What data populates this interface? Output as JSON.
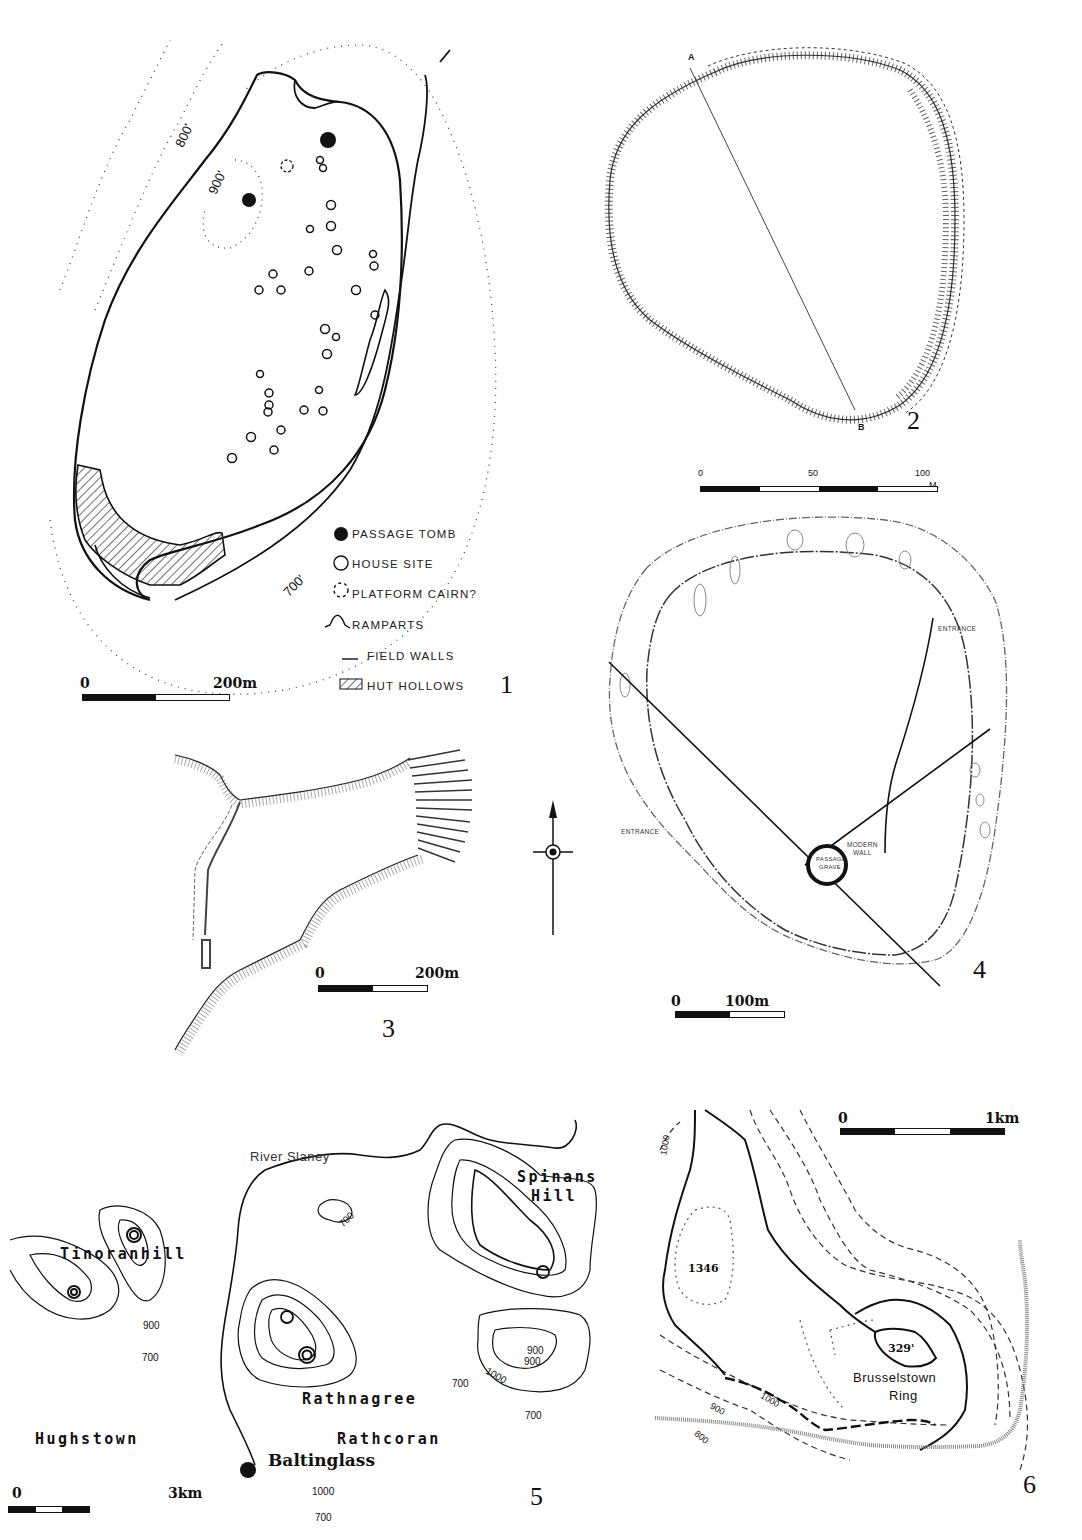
{
  "page": {
    "type": "archaeological site plans figure",
    "figures": [
      {
        "id": 1,
        "number": "1",
        "contours": [
          "800'",
          "900'",
          "700'"
        ],
        "scale": {
          "start": "0",
          "end": "200m"
        },
        "legend": [
          {
            "symbol": "filled-circle",
            "label": "PASSAGE TOMB"
          },
          {
            "symbol": "open-circle",
            "label": "HOUSE SITE"
          },
          {
            "symbol": "dashed-circle",
            "label": "PLATFORM CAIRN?"
          },
          {
            "symbol": "rampart-arc",
            "label": "RAMPARTS"
          },
          {
            "symbol": "short-line",
            "label": "FIELD WALLS"
          },
          {
            "symbol": "hatched-box",
            "label": "HUT HOLLOWS"
          }
        ]
      },
      {
        "id": 2,
        "number": "2",
        "section_labels": [
          "A",
          "B"
        ],
        "scale": {
          "start": "0",
          "mid": "50",
          "end": "100",
          "unit": "M."
        }
      },
      {
        "id": 3,
        "number": "3",
        "scale": {
          "start": "0",
          "end": "200m"
        },
        "north_arrow": true
      },
      {
        "id": 4,
        "number": "4",
        "labels": {
          "entrance_ne": "ENTRANCE",
          "entrance_w": "ENTRANCE",
          "passage_grave_1": "PASSAGE",
          "passage_grave_2": "GRAVE",
          "modern_wall_1": "MODERN",
          "modern_wall_2": "WALL"
        },
        "scale": {
          "start": "0",
          "end": "100m"
        }
      },
      {
        "id": 5,
        "number": "5",
        "river": "River Slaney",
        "places": [
          "Tinoranhill",
          "Hughstown",
          "Rathnagree",
          "Rathcoran",
          "Spinans Hill",
          "Baltinglass"
        ],
        "contour_labels": [
          "700",
          "900",
          "1000"
        ],
        "scale": {
          "start": "0",
          "end": "3km"
        }
      },
      {
        "id": 6,
        "number": "6",
        "site": "Brusselstown Ring",
        "spot_heights": [
          "1346",
          "329'"
        ],
        "contour_labels": [
          "1000",
          "900",
          "800"
        ],
        "scale": {
          "start": "0",
          "end": "1km"
        }
      }
    ]
  },
  "fig1": {
    "num": "1",
    "c800": "800'",
    "c900": "900'",
    "c700": "700'",
    "scale0": "0",
    "scale1": "200m",
    "legend": {
      "l0": "PASSAGE TOMB",
      "l1": "HOUSE SITE",
      "l2": "PLATFORM CAIRN?",
      "l3": "RAMPARTS",
      "l4": "FIELD WALLS",
      "l5": "HUT HOLLOWS"
    }
  },
  "fig2": {
    "num": "2",
    "a": "A",
    "b": "B",
    "s0": "0",
    "s50": "50",
    "s100": "100",
    "unit": "M."
  },
  "fig3": {
    "num": "3",
    "s0": "0",
    "s1": "200m"
  },
  "fig4": {
    "num": "4",
    "entrance_ne": "ENTRANCE",
    "entrance_w": "ENTRANCE",
    "pg1": "PASSAGE",
    "pg2": "GRAVE",
    "mw1": "MODERN",
    "mw2": "WALL",
    "s0": "0",
    "s1": "100m"
  },
  "fig5": {
    "num": "5",
    "river": "River Slaney",
    "tinoranhill": "Tinoranhill",
    "hughstown": "Hughstown",
    "rathnagree": "Rathnagree",
    "rathcoran": "Rathcoran",
    "spinans1": "Spinans",
    "spinans2": "Hill",
    "baltinglass": "Baltinglass",
    "c700": "700",
    "c900": "900",
    "c1000": "1000",
    "s0": "0",
    "s1": "3km"
  },
  "fig6": {
    "num": "6",
    "ring1": "Brusselstown",
    "ring2": "Ring",
    "h1346": "1346",
    "h329": "329'",
    "c1000": "1000",
    "c900": "900",
    "c800": "800",
    "s0": "0",
    "s1": "1km"
  }
}
